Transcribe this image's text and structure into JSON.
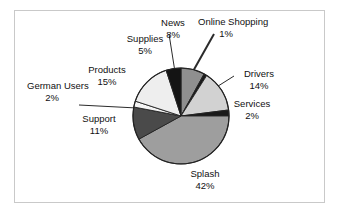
{
  "chart_data": {
    "type": "pie",
    "title": "",
    "subtitle": "",
    "xlabel": "",
    "ylabel": "",
    "legend_position": "none",
    "grid": false,
    "labels_show_percent": true,
    "categories": [
      "News",
      "Online Shopping",
      "Drivers",
      "Services",
      "Splash",
      "Support",
      "German Users",
      "Products",
      "Supplies"
    ],
    "values": [
      8,
      1,
      14,
      2,
      42,
      11,
      2,
      15,
      5
    ],
    "units": "%",
    "slices": [
      {
        "name": "News",
        "value": 8,
        "percent_label": "8%",
        "color": "#8f8f8f",
        "start_deg": 0,
        "end_deg": 28.8,
        "label_name": "News",
        "label_value": "8%"
      },
      {
        "name": "Online Shopping",
        "value": 1,
        "percent_label": "1%",
        "color": "#1a1a1a",
        "start_deg": 28.8,
        "end_deg": 32.4,
        "label_name": "Online Shopping",
        "label_value": "1%"
      },
      {
        "name": "Drivers",
        "value": 14,
        "percent_label": "14%",
        "color": "#d2d2d2",
        "start_deg": 32.4,
        "end_deg": 82.8,
        "label_name": "Drivers",
        "label_value": "14%"
      },
      {
        "name": "Services",
        "value": 2,
        "percent_label": "2%",
        "color": "#1a1a1a",
        "start_deg": 82.8,
        "end_deg": 90.0,
        "label_name": "Services",
        "label_value": "2%"
      },
      {
        "name": "Splash",
        "value": 42,
        "percent_label": "42%",
        "color": "#9e9e9e",
        "start_deg": 90.0,
        "end_deg": 241.2,
        "label_name": "Splash",
        "label_value": "42%"
      },
      {
        "name": "Support",
        "value": 11,
        "percent_label": "11%",
        "color": "#4a4a4a",
        "start_deg": 241.2,
        "end_deg": 280.8,
        "label_name": "Support",
        "label_value": "11%"
      },
      {
        "name": "German Users",
        "value": 2,
        "percent_label": "2%",
        "color": "#f5f5f5",
        "start_deg": 280.8,
        "end_deg": 288.0,
        "label_name": "German Users",
        "label_value": "2%"
      },
      {
        "name": "Products",
        "value": 15,
        "percent_label": "15%",
        "color": "#eeeeee",
        "start_deg": 288.0,
        "end_deg": 342.0,
        "label_name": "Products",
        "label_value": "15%"
      },
      {
        "name": "Supplies",
        "value": 5,
        "percent_label": "5%",
        "color": "#141414",
        "start_deg": 342.0,
        "end_deg": 360.0,
        "label_name": "Supplies",
        "label_value": "5%"
      }
    ],
    "geometry": {
      "center_x": 181,
      "center_y": 116,
      "radius": 48
    },
    "colors": {
      "outline": "#222222",
      "frame": "#c9c9c9",
      "background": "#ffffff",
      "text": "#111111",
      "leader": "#2b2b2b"
    }
  }
}
